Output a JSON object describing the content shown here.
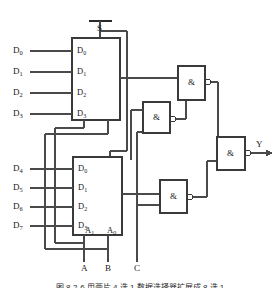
{
  "figure": {
    "type": "logic-circuit-schematic",
    "title_caption": "图 8-2-6  用两片 4 选 1 数据选择器扩展成 8 选 1",
    "output_label": "Y",
    "strobe_label": "S",
    "gate_symbol": "&",
    "inverter_bubble": true
  },
  "data_inputs": [
    {
      "label": "D",
      "sub": "0"
    },
    {
      "label": "D",
      "sub": "1"
    },
    {
      "label": "D",
      "sub": "2"
    },
    {
      "label": "D",
      "sub": "3"
    },
    {
      "label": "D",
      "sub": "4"
    },
    {
      "label": "D",
      "sub": "5"
    },
    {
      "label": "D",
      "sub": "6"
    },
    {
      "label": "D",
      "sub": "7"
    }
  ],
  "select_inputs": [
    {
      "label": "A"
    },
    {
      "label": "B"
    },
    {
      "label": "C"
    }
  ],
  "mux_top": {
    "name": "mux-top",
    "data_pins": [
      {
        "label": "D",
        "sub": "0"
      },
      {
        "label": "D",
        "sub": "1"
      },
      {
        "label": "D",
        "sub": "2"
      },
      {
        "label": "D",
        "sub": "3"
      }
    ],
    "address_pins": []
  },
  "mux_bottom": {
    "name": "mux-bottom",
    "data_pins": [
      {
        "label": "D",
        "sub": "0"
      },
      {
        "label": "D",
        "sub": "1"
      },
      {
        "label": "D",
        "sub": "2"
      },
      {
        "label": "D",
        "sub": "3"
      }
    ],
    "address_pins": [
      {
        "label": "A",
        "sub": "1"
      },
      {
        "label": "A",
        "sub": "0"
      }
    ]
  },
  "gates": [
    {
      "id": "gate-upper",
      "symbol": "&",
      "inputs": 2
    },
    {
      "id": "gate-middle",
      "symbol": "&",
      "inputs": 2
    },
    {
      "id": "gate-lower",
      "symbol": "&",
      "inputs": 2
    },
    {
      "id": "gate-output",
      "symbol": "&",
      "inputs": 2
    }
  ],
  "colors": {
    "line": "#4a4a4a",
    "box_stroke": "#3a3a3a",
    "text": "#1a1a1a",
    "background": "#ffffff"
  }
}
